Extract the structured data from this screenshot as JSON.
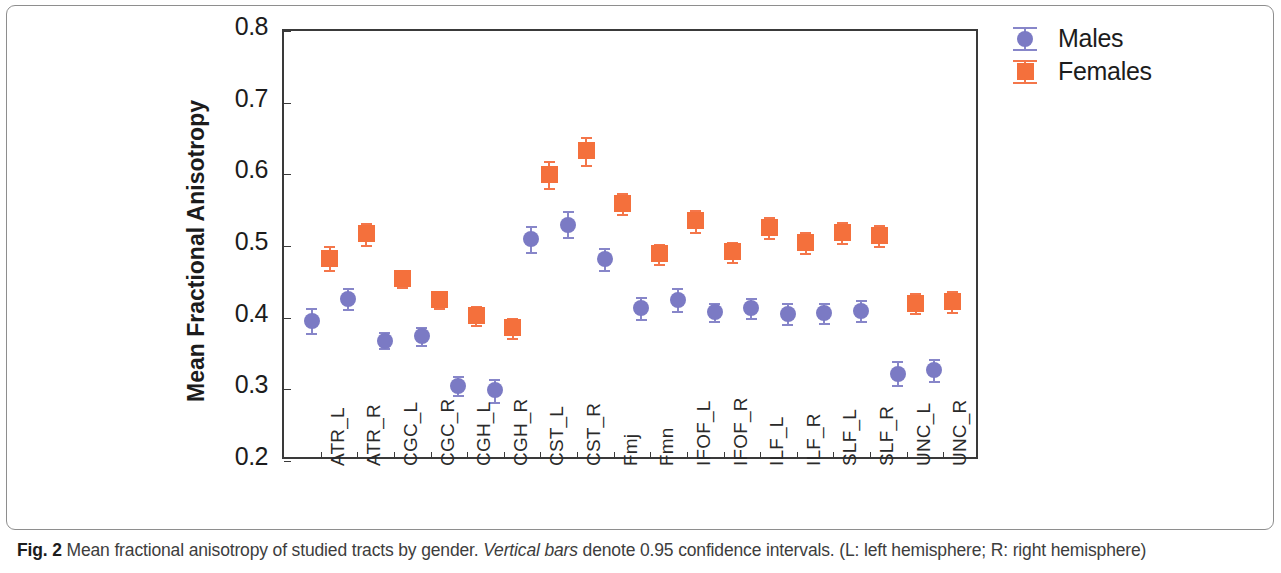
{
  "figure": {
    "caption_label": "Fig. 2",
    "caption_text_1": " Mean fractional anisotropy of studied tracts by gender. ",
    "caption_italic": "Vertical bars",
    "caption_text_2": " denote 0.95 confidence intervals. (L: left hemisphere; R: right hemisphere)"
  },
  "legend": {
    "position": "top-right",
    "entries": [
      {
        "label": "Males",
        "marker": "circle",
        "color": "#7b7ac4"
      },
      {
        "label": "Females",
        "marker": "square",
        "color": "#f4703c"
      }
    ]
  },
  "chart_data": {
    "type": "scatter",
    "title": "",
    "xlabel": "",
    "ylabel": "Mean Fractional Anisotropy",
    "ylim": [
      0.2,
      0.8
    ],
    "ytick_labels": [
      "0.8",
      "0.7",
      "0.6",
      "0.5",
      "0.4",
      "0.3",
      "0.2"
    ],
    "yticks": [
      0.8,
      0.7,
      0.6,
      0.5,
      0.4,
      0.3,
      0.2
    ],
    "grid": false,
    "error_bar_note": "0.95 confidence intervals",
    "categories": [
      "ATR_L",
      "ATR_R",
      "CGC_L",
      "CGC_R",
      "CGH_L",
      "CGH_R",
      "CST_L",
      "CST_R",
      "Fmj",
      "Fmn",
      "IFOF_L",
      "IFOF_R",
      "ILF_L",
      "ILF_R",
      "SLF_L",
      "SLF_R",
      "UNC_L",
      "UNC_R"
    ],
    "series": [
      {
        "name": "Males",
        "marker": "circle",
        "color": "#7b7ac4",
        "values": [
          0.396,
          0.426,
          0.368,
          0.374,
          0.305,
          0.299,
          0.51,
          0.53,
          0.482,
          0.413,
          0.425,
          0.408,
          0.414,
          0.405,
          0.407,
          0.41,
          0.322,
          0.327
        ],
        "ci_low": [
          0.379,
          0.412,
          0.357,
          0.362,
          0.292,
          0.283,
          0.491,
          0.512,
          0.466,
          0.398,
          0.409,
          0.395,
          0.4,
          0.391,
          0.393,
          0.395,
          0.306,
          0.312
        ],
        "ci_high": [
          0.413,
          0.441,
          0.38,
          0.387,
          0.318,
          0.314,
          0.528,
          0.549,
          0.497,
          0.429,
          0.441,
          0.421,
          0.428,
          0.42,
          0.421,
          0.425,
          0.339,
          0.342
        ]
      },
      {
        "name": "Females",
        "marker": "square",
        "color": "#f4703c",
        "values": [
          0.483,
          0.517,
          0.455,
          0.425,
          0.403,
          0.386,
          0.6,
          0.633,
          0.559,
          0.489,
          0.535,
          0.492,
          0.526,
          0.505,
          0.519,
          0.515,
          0.42,
          0.422
        ],
        "ci_low": [
          0.467,
          0.502,
          0.443,
          0.414,
          0.39,
          0.372,
          0.581,
          0.613,
          0.544,
          0.475,
          0.52,
          0.478,
          0.511,
          0.49,
          0.504,
          0.5,
          0.406,
          0.408
        ],
        "ci_high": [
          0.5,
          0.532,
          0.467,
          0.437,
          0.416,
          0.4,
          0.618,
          0.652,
          0.574,
          0.503,
          0.55,
          0.506,
          0.541,
          0.52,
          0.534,
          0.53,
          0.435,
          0.437
        ]
      }
    ]
  }
}
